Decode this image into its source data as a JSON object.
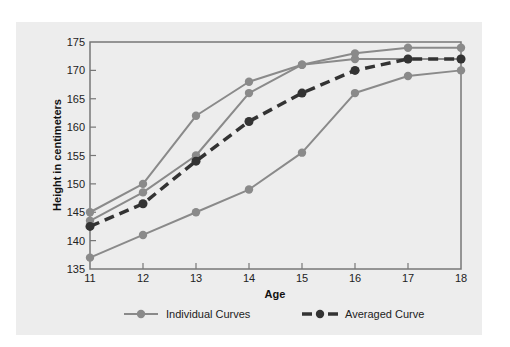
{
  "chart_data": {
    "type": "line",
    "title": "",
    "xlabel": "Age",
    "ylabel": "Height in centimeters",
    "x": [
      11,
      12,
      13,
      14,
      15,
      16,
      17,
      18
    ],
    "xlim": [
      11,
      18
    ],
    "ylim": [
      135,
      175
    ],
    "x_ticks": [
      "11",
      "12",
      "13",
      "14",
      "15",
      "16",
      "17",
      "18"
    ],
    "y_ticks": [
      "135",
      "140",
      "145",
      "150",
      "155",
      "160",
      "165",
      "170",
      "175"
    ],
    "grid": false,
    "legend_position": "bottom",
    "series": [
      {
        "name": "Individual Curves",
        "group": "individual",
        "values": [
          145,
          150,
          162,
          168,
          171,
          172,
          172,
          172
        ]
      },
      {
        "name": "Individual Curves",
        "group": "individual",
        "values": [
          143.5,
          148.5,
          155,
          166,
          171,
          173,
          174,
          174
        ]
      },
      {
        "name": "Individual Curves",
        "group": "individual",
        "values": [
          137,
          141,
          145,
          149,
          155.5,
          166,
          169,
          170
        ]
      },
      {
        "name": "Averaged Curve",
        "group": "average",
        "values": [
          142.5,
          146.5,
          154,
          161,
          166,
          170,
          172,
          172
        ]
      }
    ],
    "legend": [
      {
        "label": "Individual Curves",
        "style": "solid-gray-marker"
      },
      {
        "label": "Averaged Curve",
        "style": "dashed-dark-marker"
      }
    ],
    "colors": {
      "individual": "#8a8a8a",
      "average": "#333333",
      "axis": "#777777",
      "panel_background": "#ededed"
    }
  }
}
